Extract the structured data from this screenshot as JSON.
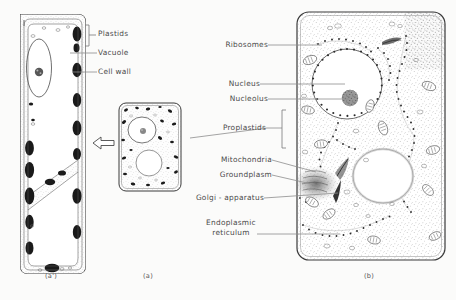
{
  "figure": {
    "background_color": "#fbfbfa",
    "ink_color": "#3a3a3a",
    "label_color": "#4a4a4a"
  },
  "panels": [
    {
      "id": "a-prime",
      "caption": "(a')",
      "description": "mature elongated plant cell with large central vacuole and wall plastids"
    },
    {
      "id": "a",
      "caption": "(a)",
      "description": "young meristematic cell, rounded, with nucleus and small vacuole"
    },
    {
      "id": "b",
      "caption": "(b)",
      "description": "electron-microscope ultrastructure of meristematic cell"
    }
  ],
  "left_labels": [
    {
      "text": "Plastids",
      "has_bracket": true,
      "has_leader": false
    },
    {
      "text": "Vacuole",
      "has_bracket": false,
      "has_leader": true
    },
    {
      "text": "Cell wall",
      "has_bracket": false,
      "has_leader": true
    }
  ],
  "right_labels": [
    {
      "text": "Ribosomes",
      "lines": [
        "Ribosomes"
      ],
      "has_bracket": false
    },
    {
      "text": "Nucleus",
      "lines": [
        "Nucleus"
      ],
      "has_bracket": false
    },
    {
      "text": "Nucleolus",
      "lines": [
        "Nucleolus"
      ],
      "has_bracket": false
    },
    {
      "text": "Proplastids",
      "lines": [
        "Proplastids"
      ],
      "has_bracket": true
    },
    {
      "text": "Mitochondria",
      "lines": [
        "Mitochondria"
      ],
      "has_bracket": false
    },
    {
      "text": "Groundplasm",
      "lines": [
        "Groundplasm"
      ],
      "has_bracket": false
    },
    {
      "text": "Golgi - apparatus",
      "lines": [
        "Golgi - apparatus"
      ],
      "has_bracket": false
    },
    {
      "text": "Endoplasmic reticulum",
      "lines": [
        "Endoplasmic",
        "reticulum"
      ],
      "has_bracket": false
    }
  ],
  "arrow": {
    "name": "development-arrow",
    "direction": "left",
    "meaning": "cell a develops into cell a-prime"
  }
}
